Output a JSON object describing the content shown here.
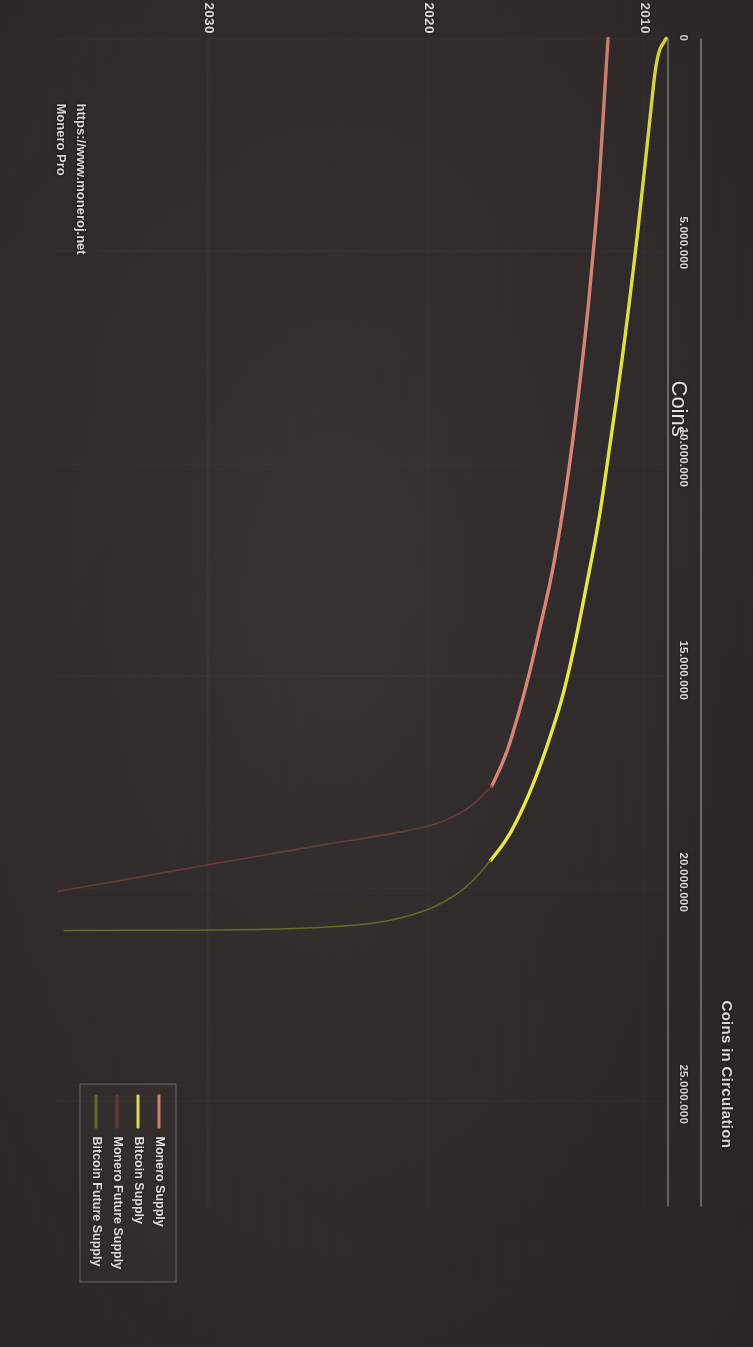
{
  "header": {
    "title": "Coins in Circulation"
  },
  "watermark": {
    "line1": "Monero Pro",
    "line2": "https://www.moneroj.net"
  },
  "legend": {
    "items": [
      {
        "label": "Monero Supply",
        "color": "#d98878"
      },
      {
        "label": "Bitcoin Supply",
        "color": "#e8e84a"
      },
      {
        "label": "Monero Future Supply",
        "color": "#6b4038"
      },
      {
        "label": "Bitcoin Future Supply",
        "color": "#6f6f28"
      }
    ]
  },
  "chart_data": {
    "type": "line",
    "title": "Coins in Circulation",
    "xlabel": "",
    "ylabel": "Coins",
    "xlim": [
      2009,
      2062
    ],
    "ylim": [
      0,
      27500000
    ],
    "grid": true,
    "legend_position": "bottom-left",
    "xticks": [
      2010,
      2020,
      2030,
      2040,
      2050,
      2060
    ],
    "xticklabels": [
      "2010",
      "2020",
      "2030",
      "2040",
      "2050",
      "2060"
    ],
    "yticks": [
      0,
      5000000,
      10000000,
      15000000,
      20000000,
      25000000
    ],
    "yticklabels": [
      "0",
      "5.000.000",
      "10.000.000",
      "15.000.000",
      "20.000.000",
      "25.000.000"
    ],
    "series": [
      {
        "name": "Bitcoin Supply",
        "color": "#e8e84a",
        "style": "solid",
        "points": [
          [
            2009.2,
            0
          ],
          [
            2010.0,
            350000
          ],
          [
            2010.6,
            1900000
          ],
          [
            2011.3,
            3700000
          ],
          [
            2012.0,
            5400000
          ],
          [
            2013.0,
            7600000
          ],
          [
            2014.0,
            9500000
          ],
          [
            2015.0,
            11400000
          ],
          [
            2016.0,
            12800000
          ],
          [
            2017.0,
            14200000
          ],
          [
            2018.0,
            15400000
          ],
          [
            2019.0,
            16300000
          ],
          [
            2020.0,
            17100000
          ],
          [
            2021.0,
            17800000
          ],
          [
            2022.0,
            18400000
          ],
          [
            2023.0,
            18900000
          ],
          [
            2024.3,
            19350000
          ]
        ]
      },
      {
        "name": "Monero Supply",
        "color": "#d98878",
        "style": "solid",
        "points": [
          [
            2014.2,
            0
          ],
          [
            2014.6,
            1700000
          ],
          [
            2015.0,
            3600000
          ],
          [
            2015.6,
            5400000
          ],
          [
            2016.0,
            6600000
          ],
          [
            2017.0,
            9000000
          ],
          [
            2018.0,
            11000000
          ],
          [
            2019.0,
            12600000
          ],
          [
            2020.0,
            13800000
          ],
          [
            2021.0,
            15000000
          ],
          [
            2022.0,
            16000000
          ],
          [
            2023.0,
            16900000
          ],
          [
            2024.2,
            17600000
          ]
        ]
      },
      {
        "name": "Bitcoin Future Supply",
        "color": "#6f6f28",
        "style": "solid",
        "points": [
          [
            2024.3,
            19350000
          ],
          [
            2026.0,
            19900000
          ],
          [
            2028.0,
            20300000
          ],
          [
            2030.0,
            20550000
          ],
          [
            2033.0,
            20780000
          ],
          [
            2036.0,
            20880000
          ],
          [
            2040.0,
            20950000
          ],
          [
            2045.0,
            20985000
          ],
          [
            2050.0,
            20995000
          ],
          [
            2055.0,
            20999000
          ],
          [
            2061.0,
            21000000
          ]
        ]
      },
      {
        "name": "Monero Future Supply",
        "color": "#6b4038",
        "style": "solid",
        "points": [
          [
            2024.2,
            17600000
          ],
          [
            2026.0,
            18100000
          ],
          [
            2028.0,
            18400000
          ],
          [
            2030.0,
            18580000
          ],
          [
            2034.0,
            18780000
          ],
          [
            2038.0,
            18950000
          ],
          [
            2042.0,
            19140000
          ],
          [
            2046.0,
            19330000
          ],
          [
            2050.0,
            19520000
          ],
          [
            2054.0,
            19720000
          ],
          [
            2058.0,
            19910000
          ],
          [
            2061.5,
            20080000
          ]
        ]
      }
    ]
  }
}
